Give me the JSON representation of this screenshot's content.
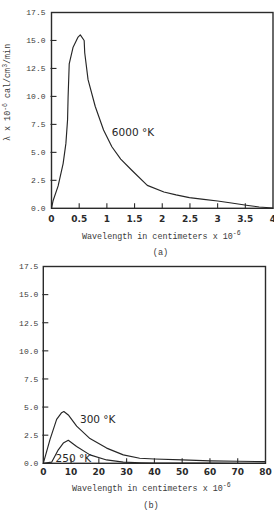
{
  "chart_data": [
    {
      "type": "line",
      "panel_label": "(a)",
      "title": "",
      "xlabel": "Wavelength in centimeters x 10^-6",
      "xlabel_parts": {
        "base": "Wavelength in centimeters x 10",
        "exp": "-6"
      },
      "ylabel": "λ x 10^-6 cal/cm^3/min",
      "ylabel_parts": {
        "a": "λ x 10",
        "a_exp": "-6",
        "b": " cal/cm",
        "b_exp": "3",
        "c": "/min"
      },
      "xlim": [
        0,
        4
      ],
      "ylim": [
        0,
        17.5
      ],
      "grid": false,
      "legend": "none (inline curve labels)",
      "xticks": [
        0,
        0.5,
        1,
        1.5,
        2,
        2.5,
        3,
        3.5,
        4
      ],
      "xtick_labels": [
        "0",
        "0.5",
        "1",
        "1.5",
        "2",
        "2.5",
        "3",
        "3.5",
        "4"
      ],
      "yticks": [
        0,
        2.5,
        5,
        7.5,
        10,
        12.5,
        15,
        17.5
      ],
      "ytick_labels": [
        "0.0",
        "2.5",
        "5.0",
        "7.5",
        "10.0",
        "12.5",
        "15.0",
        "17.5"
      ],
      "series": [
        {
          "name": "6000 °K",
          "x": [
            0,
            0.03,
            0.12,
            0.21,
            0.26,
            0.29,
            0.3,
            0.32,
            0.39,
            0.48,
            0.52,
            0.59,
            0.6,
            0.66,
            0.79,
            0.94,
            1.09,
            1.25,
            1.45,
            1.73,
            2.03,
            2.25,
            2.49,
            2.75,
            3.0,
            3.25,
            3.55,
            3.75,
            4.0
          ],
          "y": [
            0,
            0.7,
            2.0,
            4.0,
            5.8,
            7.9,
            10.0,
            12.9,
            14.4,
            15.3,
            15.5,
            15.0,
            13.9,
            11.5,
            9.1,
            7.0,
            5.5,
            4.4,
            3.4,
            2.05,
            1.46,
            1.2,
            0.95,
            0.8,
            0.65,
            0.47,
            0.25,
            0.12,
            0.03
          ]
        }
      ],
      "annotations": [
        {
          "text": "6000 °K",
          "x": 1.09,
          "y": 6.5
        }
      ]
    },
    {
      "type": "line",
      "panel_label": "(b)",
      "title": "",
      "xlabel": "Wavelength in centimeters x 10^-6",
      "xlabel_parts": {
        "base": "Wavelength in centimeters x 10",
        "exp": "-6"
      },
      "ylabel": "",
      "xlim": [
        0,
        80
      ],
      "ylim": [
        0,
        17.5
      ],
      "grid": false,
      "legend": "none (inline curve labels)",
      "xticks": [
        0,
        10,
        20,
        30,
        40,
        50,
        60,
        70,
        80
      ],
      "xtick_labels": [
        "0",
        "10",
        "20",
        "30",
        "40",
        "50",
        "60",
        "70",
        "80"
      ],
      "yticks": [
        0,
        2.5,
        5,
        7.5,
        10,
        12.5,
        15,
        17.5
      ],
      "ytick_labels": [
        "0.0",
        "2.5",
        "5.0",
        "7.5",
        "10.0",
        "12.5",
        "15.0",
        "17.5"
      ],
      "series": [
        {
          "name": "300 °K",
          "x": [
            0,
            2.4,
            4.8,
            6.6,
            7.4,
            9.0,
            12.0,
            16.8,
            22.8,
            28.8,
            34.7,
            40,
            50,
            60,
            70,
            80
          ],
          "y": [
            0,
            2.1,
            3.9,
            4.5,
            4.6,
            4.3,
            3.3,
            2.2,
            1.35,
            0.75,
            0.45,
            0.38,
            0.3,
            0.22,
            0.18,
            0.15
          ]
        },
        {
          "name": "250 °K",
          "x": [
            0,
            3.0,
            5.4,
            7.2,
            9.0,
            12.0,
            16.8,
            22.8,
            28.8,
            35,
            40,
            50,
            60,
            70,
            80
          ],
          "y": [
            0,
            0.1,
            1.2,
            1.8,
            2.05,
            1.5,
            0.75,
            0.3,
            0.1,
            0.05,
            0.03,
            0.02,
            0.01,
            0,
            0
          ]
        }
      ],
      "annotations": [
        {
          "text": "300 °K",
          "x": 13.2,
          "y": 3.6
        },
        {
          "text": "250 °K",
          "x": 4.4,
          "y": 0.12
        }
      ]
    }
  ]
}
